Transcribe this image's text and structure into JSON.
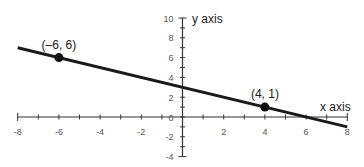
{
  "chart_data": {
    "type": "line",
    "title": "",
    "xlabel": "x axis",
    "ylabel": "y axis",
    "xlim": [
      -8,
      8
    ],
    "ylim": [
      -4,
      10
    ],
    "x_ticks": [
      -8,
      -6,
      -4,
      -2,
      0,
      2,
      4,
      6,
      8
    ],
    "x_tick_labels": [
      "-8",
      "-6",
      "-4",
      "-2",
      "0",
      "2",
      "4",
      "6",
      "8"
    ],
    "x_minor_step": 1,
    "y_ticks": [
      -4,
      -2,
      0,
      2,
      4,
      6,
      8,
      10
    ],
    "y_tick_labels": [
      "-4",
      "-2",
      "0",
      "2",
      "4",
      "6",
      "8",
      "10"
    ],
    "y_minor_step": 1,
    "grid": false,
    "line": {
      "slope": -0.5,
      "intercept": 3,
      "x_range": [
        -8,
        8
      ],
      "color": "#1a1a1a"
    },
    "points": [
      {
        "x": -6,
        "y": 6,
        "label": "(–6, 6)"
      },
      {
        "x": 4,
        "y": 1,
        "label": "(4, 1)"
      }
    ],
    "axis_color": "#333333"
  }
}
